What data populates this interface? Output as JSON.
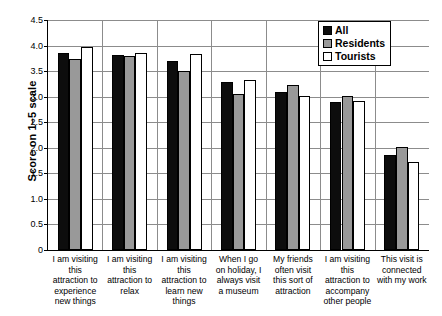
{
  "chart_data": {
    "type": "bar",
    "title": "",
    "xlabel": "",
    "ylabel": "Score on 1–5 scale",
    "ylim": [
      0,
      4.5
    ],
    "ytick_step": 0.5,
    "ticks": [
      "0",
      "0.5",
      "1.0",
      "1.5",
      "2.0",
      "2.5",
      "3.0",
      "3.5",
      "4.0",
      "4.5"
    ],
    "grid": true,
    "legend_position": "top-right",
    "categories": [
      "I am visiting this attraction to experience new things",
      "I am visiting this attraction to relax",
      "I am visiting this attraction to learn new things",
      "When I go on holiday, I always visit a museum",
      "My friends often visit this sort of attraction",
      "I am visiting this attraction to accompany other people",
      "This visit is connected with my work"
    ],
    "series": [
      {
        "name": "All",
        "color": "#0d0d0d",
        "values": [
          3.85,
          3.82,
          3.7,
          3.28,
          3.1,
          2.9,
          1.85
        ]
      },
      {
        "name": "Residents",
        "color": "#999999",
        "values": [
          3.73,
          3.79,
          3.5,
          3.06,
          3.22,
          3.02,
          2.02
        ]
      },
      {
        "name": "Tourists",
        "color": "#ffffff",
        "values": [
          3.97,
          3.86,
          3.84,
          3.33,
          3.01,
          2.92,
          1.72
        ]
      }
    ]
  }
}
